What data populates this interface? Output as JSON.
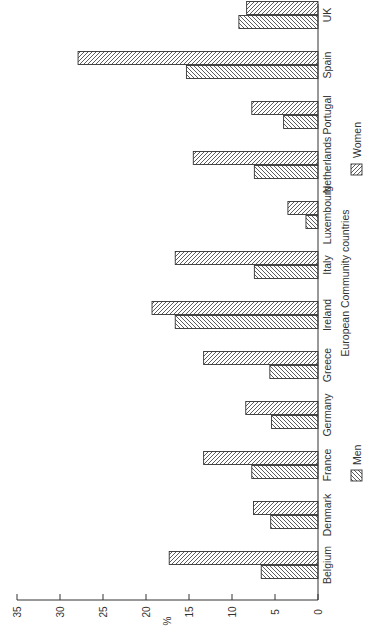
{
  "chart_data": {
    "type": "bar",
    "orientation": "rotated-90-ccw",
    "title": "",
    "xlabel": "European Community countries",
    "ylabel": "%",
    "ylim": [
      0,
      35
    ],
    "yticks": [
      0,
      5,
      10,
      15,
      20,
      25,
      30,
      35
    ],
    "grid": false,
    "legend_position": "right-of-axis-label",
    "categories": [
      "Belgium",
      "Denmark",
      "France",
      "Germany",
      "Greece",
      "Ireland",
      "Italy",
      "Luxembourg",
      "Netherlands",
      "Portugal",
      "Spain",
      "UK"
    ],
    "series": [
      {
        "name": "Men",
        "hatch": "backslash",
        "values": [
          6.6,
          5.5,
          7.7,
          5.4,
          5.6,
          16.6,
          7.4,
          1.4,
          7.4,
          4.0,
          15.3,
          9.2
        ]
      },
      {
        "name": "Women",
        "hatch": "slash",
        "values": [
          17.3,
          7.5,
          13.3,
          8.4,
          13.3,
          19.3,
          16.6,
          3.5,
          14.5,
          7.7,
          27.9,
          8.3
        ]
      }
    ]
  },
  "legend": {
    "men_label": "Men",
    "women_label": "Women"
  },
  "axis": {
    "y_title": "%",
    "x_title": "European Community countries"
  },
  "colors": {
    "ink": "#333333",
    "fill": "#ffffff"
  }
}
